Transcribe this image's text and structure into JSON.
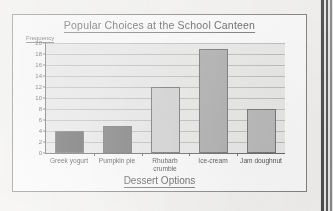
{
  "sheet": {
    "binding_strip": "page-binding-strip"
  },
  "chart_data": {
    "type": "bar",
    "title": "Popular Choices at the School Canteen",
    "xlabel": "Dessert Options",
    "ylabel": "Frequency",
    "categories": [
      "Greek yogurt",
      "Pumpkin pie",
      "Rhubarb crumble",
      "Ice-cream",
      "Jam doughnut"
    ],
    "values": [
      4,
      5,
      12,
      19,
      8
    ],
    "bar_colors": [
      "#585858",
      "#6f6f6f",
      "#d0d0d0",
      "#a8a8a8",
      "#b4b4b4"
    ],
    "ylim": [
      0,
      20
    ],
    "ytick_step": 2,
    "ytick_labels": [
      "20",
      "18",
      "16",
      "14",
      "12",
      "10",
      "8",
      "6",
      "4",
      "2",
      "0"
    ],
    "grid": true,
    "legend": "none",
    "plot_background": "#e8e8e6",
    "axis_color": "#5d5d5d"
  }
}
